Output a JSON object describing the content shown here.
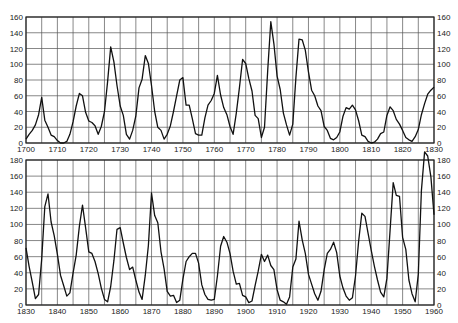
{
  "chart_data": [
    {
      "type": "line",
      "title": "",
      "xlabel": "",
      "ylabel": "",
      "xlim": [
        1700,
        1830
      ],
      "ylim": [
        0,
        160
      ],
      "grid": true,
      "legend": null,
      "x_ticks": [
        1700,
        1710,
        1720,
        1730,
        1740,
        1750,
        1760,
        1770,
        1780,
        1790,
        1800,
        1810,
        1820,
        1830
      ],
      "y_ticks": [
        0,
        20,
        40,
        60,
        80,
        100,
        120,
        140,
        160
      ],
      "y_axis_both_sides": true,
      "series": [
        {
          "name": "Sunspot number",
          "x": [
            1700,
            1701,
            1702,
            1703,
            1704,
            1705,
            1706,
            1707,
            1708,
            1709,
            1710,
            1711,
            1712,
            1713,
            1714,
            1715,
            1716,
            1717,
            1718,
            1719,
            1720,
            1721,
            1722,
            1723,
            1724,
            1725,
            1726,
            1727,
            1728,
            1729,
            1730,
            1731,
            1732,
            1733,
            1734,
            1735,
            1736,
            1737,
            1738,
            1739,
            1740,
            1741,
            1742,
            1743,
            1744,
            1745,
            1746,
            1747,
            1748,
            1749,
            1750,
            1751,
            1752,
            1753,
            1754,
            1755,
            1756,
            1757,
            1758,
            1759,
            1760,
            1761,
            1762,
            1763,
            1764,
            1765,
            1766,
            1767,
            1768,
            1769,
            1770,
            1771,
            1772,
            1773,
            1774,
            1775,
            1776,
            1777,
            1778,
            1779,
            1780,
            1781,
            1782,
            1783,
            1784,
            1785,
            1786,
            1787,
            1788,
            1789,
            1790,
            1791,
            1792,
            1793,
            1794,
            1795,
            1796,
            1797,
            1798,
            1799,
            1800,
            1801,
            1802,
            1803,
            1804,
            1805,
            1806,
            1807,
            1808,
            1809,
            1810,
            1811,
            1812,
            1813,
            1814,
            1815,
            1816,
            1817,
            1818,
            1819,
            1820,
            1821,
            1822,
            1823,
            1824,
            1825,
            1826,
            1827,
            1828,
            1829,
            1830
          ],
          "values": [
            5,
            11,
            16,
            23,
            36,
            58,
            29,
            20,
            10,
            8,
            3,
            0,
            0,
            2,
            11,
            27,
            47,
            63,
            60,
            39,
            28,
            26,
            22,
            11,
            21,
            40,
            78,
            122,
            103,
            73,
            47,
            35,
            11,
            5,
            16,
            34,
            70,
            81,
            111,
            101,
            73,
            40,
            20,
            16,
            5,
            11,
            22,
            40,
            60,
            80,
            83,
            48,
            48,
            31,
            12,
            10,
            10,
            32,
            48,
            54,
            63,
            86,
            61,
            45,
            36,
            21,
            11,
            38,
            70,
            106,
            101,
            82,
            66,
            35,
            31,
            7,
            20,
            92,
            154,
            126,
            85,
            68,
            38,
            23,
            10,
            24,
            83,
            132,
            131,
            118,
            90,
            67,
            60,
            47,
            41,
            21,
            16,
            6,
            4,
            7,
            14,
            34,
            45,
            43,
            48,
            42,
            28,
            10,
            8,
            2,
            0,
            1,
            5,
            12,
            14,
            35,
            46,
            41,
            30,
            24,
            16,
            7,
            4,
            2,
            8,
            17,
            36,
            50,
            62,
            67,
            71
          ]
        }
      ]
    },
    {
      "type": "line",
      "title": "",
      "xlabel": "",
      "ylabel": "",
      "xlim": [
        1830,
        1960
      ],
      "ylim": [
        0,
        180
      ],
      "grid": true,
      "legend": null,
      "x_ticks": [
        1830,
        1840,
        1850,
        1860,
        1870,
        1880,
        1890,
        1900,
        1910,
        1920,
        1930,
        1940,
        1950,
        1960
      ],
      "y_ticks": [
        0,
        20,
        40,
        60,
        80,
        100,
        120,
        140,
        160,
        180
      ],
      "y_axis_both_sides": true,
      "series": [
        {
          "name": "Sunspot number",
          "x": [
            1830,
            1831,
            1832,
            1833,
            1834,
            1835,
            1836,
            1837,
            1838,
            1839,
            1840,
            1841,
            1842,
            1843,
            1844,
            1845,
            1846,
            1847,
            1848,
            1849,
            1850,
            1851,
            1852,
            1853,
            1854,
            1855,
            1856,
            1857,
            1858,
            1859,
            1860,
            1861,
            1862,
            1863,
            1864,
            1865,
            1866,
            1867,
            1868,
            1869,
            1870,
            1871,
            1872,
            1873,
            1874,
            1875,
            1876,
            1877,
            1878,
            1879,
            1880,
            1881,
            1882,
            1883,
            1884,
            1885,
            1886,
            1887,
            1888,
            1889,
            1890,
            1891,
            1892,
            1893,
            1894,
            1895,
            1896,
            1897,
            1898,
            1899,
            1900,
            1901,
            1902,
            1903,
            1904,
            1905,
            1906,
            1907,
            1908,
            1909,
            1910,
            1911,
            1912,
            1913,
            1914,
            1915,
            1916,
            1917,
            1918,
            1919,
            1920,
            1921,
            1922,
            1923,
            1924,
            1925,
            1926,
            1927,
            1928,
            1929,
            1930,
            1931,
            1932,
            1933,
            1934,
            1935,
            1936,
            1937,
            1938,
            1939,
            1940,
            1941,
            1942,
            1943,
            1944,
            1945,
            1946,
            1947,
            1948,
            1949,
            1950,
            1951,
            1952,
            1953,
            1954,
            1955,
            1956,
            1957,
            1958,
            1959,
            1960
          ],
          "values": [
            71,
            48,
            28,
            8,
            13,
            57,
            122,
            138,
            103,
            86,
            63,
            37,
            24,
            11,
            15,
            40,
            62,
            98,
            124,
            96,
            66,
            64,
            54,
            39,
            21,
            7,
            4,
            23,
            55,
            94,
            96,
            77,
            59,
            44,
            47,
            31,
            16,
            7,
            37,
            74,
            139,
            111,
            102,
            66,
            45,
            17,
            11,
            12,
            3,
            6,
            32,
            54,
            60,
            64,
            64,
            52,
            25,
            13,
            7,
            6,
            7,
            36,
            73,
            85,
            78,
            64,
            42,
            26,
            27,
            12,
            10,
            3,
            5,
            24,
            42,
            63,
            54,
            62,
            49,
            44,
            19,
            6,
            4,
            1,
            10,
            47,
            57,
            104,
            81,
            64,
            38,
            26,
            14,
            6,
            17,
            44,
            64,
            69,
            78,
            65,
            36,
            21,
            11,
            6,
            9,
            36,
            80,
            114,
            110,
            89,
            68,
            48,
            31,
            16,
            10,
            33,
            93,
            152,
            136,
            135,
            84,
            69,
            31,
            14,
            4,
            38,
            142,
            190,
            185,
            159,
            112
          ]
        }
      ]
    }
  ]
}
